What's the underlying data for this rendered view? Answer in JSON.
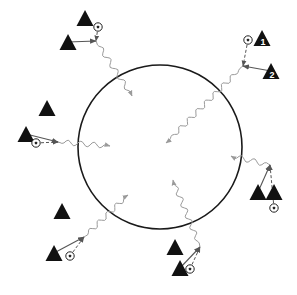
{
  "diagram": {
    "colors": {
      "background": "#ffffff",
      "circle": "#1a1a1a",
      "player": "#111111",
      "pass_arrow": "#555555",
      "dribble_path": "#9a9a9a"
    },
    "circle": {
      "cx": 160,
      "cy": 147,
      "r": 82
    },
    "legend_icons": {
      "player": "triangle-player-icon",
      "ball": "soccer-ball-icon"
    },
    "groups": [
      {
        "id": "top-left",
        "players": [
          {
            "x": 85,
            "y": 18,
            "label": ""
          },
          {
            "x": 68,
            "y": 42,
            "label": ""
          }
        ],
        "ball": {
          "x": 98,
          "y": 27
        },
        "meet": {
          "x": 96,
          "y": 41
        },
        "dribble": {
          "x1": 96,
          "y1": 41,
          "x2": 132,
          "y2": 96
        }
      },
      {
        "id": "top-right",
        "players": [
          {
            "x": 262,
            "y": 38,
            "label": "1"
          },
          {
            "x": 271,
            "y": 71,
            "label": "2"
          }
        ],
        "ball": {
          "x": 248,
          "y": 40
        },
        "meet": {
          "x": 243,
          "y": 66
        },
        "dribble": {
          "x1": 243,
          "y1": 66,
          "x2": 166,
          "y2": 143
        }
      },
      {
        "id": "left",
        "players": [
          {
            "x": 47,
            "y": 108,
            "label": ""
          },
          {
            "x": 26,
            "y": 134,
            "label": ""
          }
        ],
        "ball": {
          "x": 36,
          "y": 143
        },
        "meet": {
          "x": 58,
          "y": 142
        },
        "dribble": {
          "x1": 58,
          "y1": 142,
          "x2": 110,
          "y2": 146
        }
      },
      {
        "id": "bottom-left",
        "players": [
          {
            "x": 62,
            "y": 211,
            "label": ""
          },
          {
            "x": 54,
            "y": 253,
            "label": ""
          }
        ],
        "ball": {
          "x": 70,
          "y": 256
        },
        "meet": {
          "x": 84,
          "y": 237
        },
        "dribble": {
          "x1": 84,
          "y1": 237,
          "x2": 128,
          "y2": 195
        }
      },
      {
        "id": "bottom-middle",
        "players": [
          {
            "x": 175,
            "y": 247,
            "label": ""
          },
          {
            "x": 180,
            "y": 268,
            "label": ""
          }
        ],
        "ball": {
          "x": 190,
          "y": 269
        },
        "meet": {
          "x": 200,
          "y": 247
        },
        "dribble": {
          "x1": 200,
          "y1": 247,
          "x2": 173,
          "y2": 180
        }
      },
      {
        "id": "right",
        "players": [
          {
            "x": 258,
            "y": 192,
            "label": ""
          },
          {
            "x": 274,
            "y": 192,
            "label": ""
          }
        ],
        "ball": {
          "x": 274,
          "y": 208
        },
        "meet": {
          "x": 270,
          "y": 165
        },
        "dribble": {
          "x1": 270,
          "y1": 165,
          "x2": 231,
          "y2": 156
        }
      }
    ]
  }
}
